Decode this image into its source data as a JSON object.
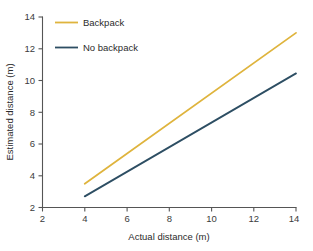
{
  "chart_data": {
    "type": "line",
    "title": "",
    "xlabel": "Actual distance (m)",
    "ylabel": "Estimated distance (m)",
    "xlim": [
      2,
      14
    ],
    "ylim": [
      2,
      14
    ],
    "xticks": [
      2,
      4,
      6,
      8,
      10,
      12,
      14
    ],
    "yticks": [
      2,
      4,
      6,
      8,
      10,
      12,
      14
    ],
    "xtick_labels": [
      "2",
      "4",
      "6",
      "8",
      "10",
      "12",
      "14"
    ],
    "ytick_labels": [
      "2",
      "4",
      "6",
      "8",
      "10",
      "12",
      "14"
    ],
    "grid": false,
    "legend_position": "upper left",
    "series": [
      {
        "name": "Backpack",
        "color": "#DFB43D",
        "x": [
          4,
          14
        ],
        "values": [
          3.5,
          13.0
        ]
      },
      {
        "name": "No backpack",
        "color": "#2D4E63",
        "x": [
          4,
          14
        ],
        "values": [
          2.7,
          10.45
        ]
      }
    ]
  },
  "legend": {
    "entries": [
      {
        "label": "Backpack",
        "color": "#DFB43D"
      },
      {
        "label": "No backpack",
        "color": "#2D4E63"
      }
    ]
  },
  "axes": {
    "x_title": "Actual distance (m)",
    "y_title": "Estimated distance (m)",
    "x_labels": [
      "2",
      "4",
      "6",
      "8",
      "10",
      "12",
      "14"
    ],
    "y_labels": [
      "2",
      "4",
      "6",
      "8",
      "10",
      "12",
      "14"
    ]
  },
  "colors": {
    "backpack": "#DFB43D",
    "no_backpack": "#2D4E63",
    "axis": "#555555",
    "text": "#2b2b2b",
    "background": "#ffffff"
  }
}
